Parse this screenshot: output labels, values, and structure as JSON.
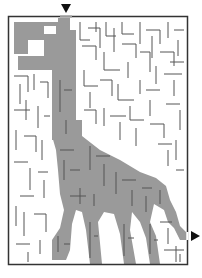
{
  "puzzle": {
    "type": "maze",
    "subject": "brachiosaurus dinosaur silhouette",
    "entry_marker": "down-arrow",
    "exit_marker": "right-arrow"
  },
  "colors": {
    "background": "#ffffff",
    "walls": "#555555",
    "silhouette": "#9a9a9a",
    "frame": "#333333",
    "arrows": "#111111"
  }
}
